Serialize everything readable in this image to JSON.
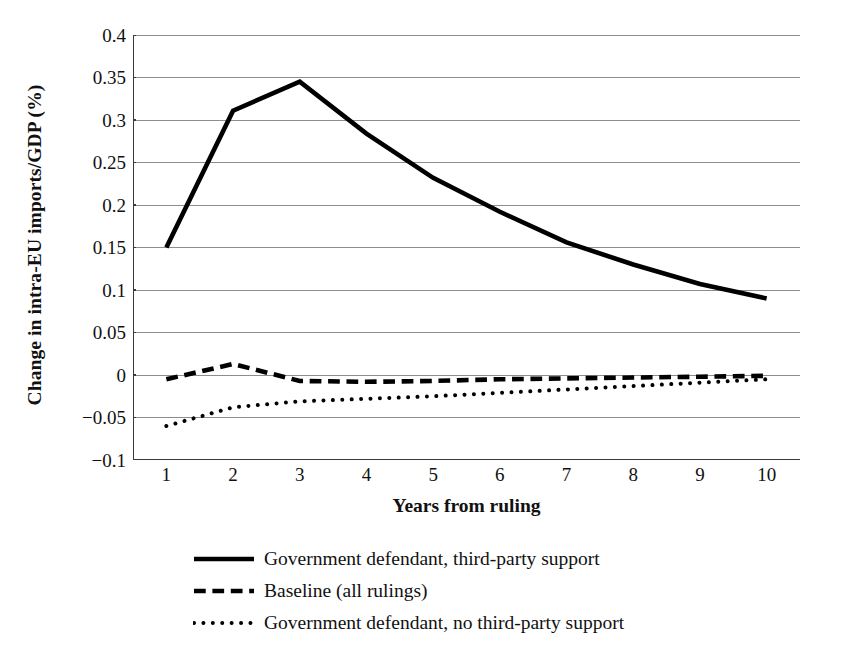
{
  "chart_data": {
    "type": "line",
    "title": "",
    "xlabel": "Years from ruling",
    "ylabel": "Change in intra-EU imports/GDP (%)",
    "categories": [
      "1",
      "2",
      "3",
      "4",
      "5",
      "6",
      "7",
      "8",
      "9",
      "10"
    ],
    "x": [
      1,
      2,
      3,
      4,
      5,
      6,
      7,
      8,
      9,
      10
    ],
    "ylim": [
      -0.1,
      0.4
    ],
    "yticks": [
      0.4,
      0.35,
      0.3,
      0.25,
      0.2,
      0.15,
      0.1,
      0.05,
      0,
      -0.05,
      -0.1
    ],
    "ytick_labels": [
      "0.4",
      "0.35",
      "0.3",
      "0.25",
      "0.2",
      "0.15",
      "0.1",
      "0.05",
      "0",
      "−0.05",
      "−0.1"
    ],
    "grid": true,
    "grid_axis": "y",
    "legend_position": "below",
    "series": [
      {
        "name": "Government defendant, third-party support",
        "style": "solid",
        "color": "#000000",
        "width": 4.6,
        "values": [
          0.15,
          0.311,
          0.345,
          0.284,
          0.232,
          0.192,
          0.156,
          0.13,
          0.107,
          0.09
        ]
      },
      {
        "name": "Baseline (all rulings)",
        "style": "dashed",
        "color": "#000000",
        "width": 4.6,
        "values": [
          -0.005,
          0.013,
          -0.007,
          -0.008,
          -0.007,
          -0.005,
          -0.004,
          -0.003,
          -0.002,
          -0.001
        ]
      },
      {
        "name": "Government defendant, no third-party support",
        "style": "dotted",
        "color": "#000000",
        "width": 4.0,
        "values": [
          -0.06,
          -0.038,
          -0.031,
          -0.028,
          -0.025,
          -0.021,
          -0.017,
          -0.013,
          -0.009,
          -0.005
        ]
      }
    ]
  },
  "legend": {
    "items": [
      {
        "label": "Government defendant, third-party support",
        "key": "solid-line-key"
      },
      {
        "label": "Baseline (all rulings)",
        "key": "dashed-line-key"
      },
      {
        "label": "Government defendant, no third-party support",
        "key": "dotted-line-key"
      }
    ]
  },
  "colors": {
    "series": "#000000",
    "grid": "#8d8d8d",
    "axis": "#3b3b3b",
    "background": "#ffffff"
  }
}
